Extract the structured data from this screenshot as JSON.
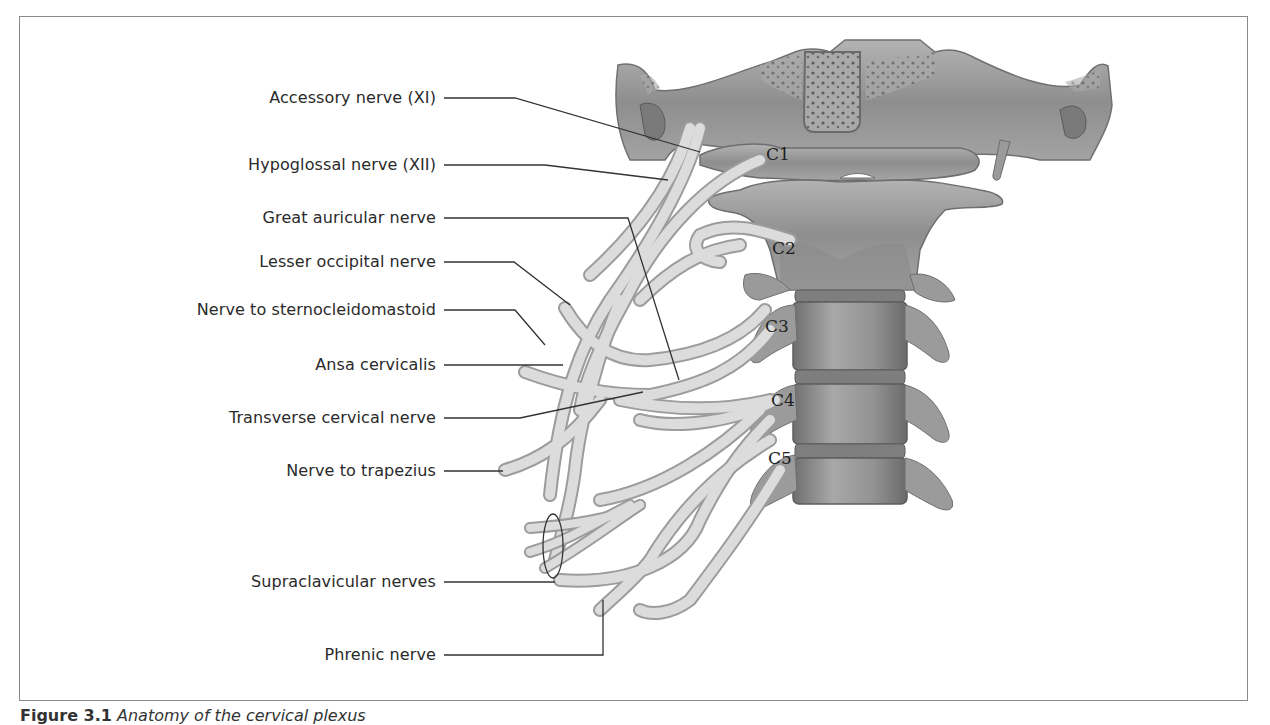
{
  "figure": {
    "caption_prefix": "Figure 3.1",
    "caption_text": "Anatomy of the cervical plexus"
  },
  "labels": [
    {
      "id": "accessory",
      "text": "Accessory nerve (XI)"
    },
    {
      "id": "hypoglossal",
      "text": "Hypoglossal nerve (XII)"
    },
    {
      "id": "great-auricular",
      "text": "Great auricular nerve"
    },
    {
      "id": "lesser-occipital",
      "text": "Lesser occipital nerve"
    },
    {
      "id": "nerve-scm",
      "text": "Nerve to sternocleidomastoid"
    },
    {
      "id": "ansa",
      "text": "Ansa cervicalis"
    },
    {
      "id": "transverse-cervical",
      "text": "Transverse cervical nerve"
    },
    {
      "id": "nerve-trapezius",
      "text": "Nerve to trapezius"
    },
    {
      "id": "supraclavicular",
      "text": "Supraclavicular nerves"
    },
    {
      "id": "phrenic",
      "text": "Phrenic nerve"
    }
  ],
  "vertebrae": [
    "C1",
    "C2",
    "C3",
    "C4",
    "C5"
  ],
  "colors": {
    "bone": "#9a9a9a",
    "bone_dark": "#6e6e6e",
    "nerve": "#dcdcdc",
    "nerve_edge": "#9c9c9c",
    "leader": "#333333",
    "frame": "#8a8a8a"
  }
}
